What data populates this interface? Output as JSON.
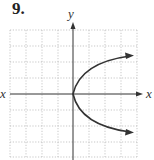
{
  "problem_number": "9.",
  "axes": {
    "x_label": "x",
    "x_label_left": "x",
    "y_label": "y"
  },
  "grid": {
    "cols": 8,
    "rows": 8,
    "line_style": "dotted"
  },
  "curve": {
    "type": "parabola",
    "opens": "right",
    "vertex": [
      0,
      0
    ],
    "description": "sideways parabola x = y^2 with arrowheads at both ends"
  },
  "colors": {
    "curve": "#333333",
    "grid": "#bbbbbb",
    "axes": "#333333"
  }
}
